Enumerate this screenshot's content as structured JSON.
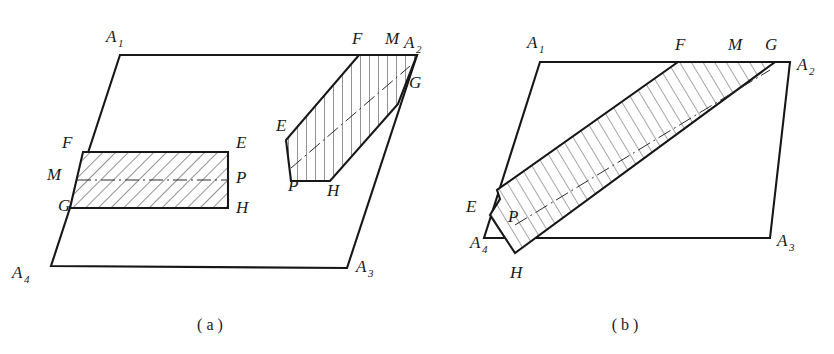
{
  "figure": {
    "background_color": "#ffffff",
    "line_color": "#171717"
  },
  "panel_a": {
    "caption": "( a )",
    "caption_x": 210,
    "caption_y": 330,
    "parallelogram": {
      "name": "outer-parallelogram-a",
      "points": "120,55 417,55 347,268 51,266",
      "vertex_labels": [
        {
          "id": "A",
          "sub": "1",
          "x": 106,
          "y": 42
        },
        {
          "id": "A",
          "sub": "2",
          "x": 404,
          "y": 48
        },
        {
          "id": "A",
          "sub": "3",
          "x": 356,
          "y": 272
        },
        {
          "id": "A",
          "sub": "4",
          "x": 12,
          "y": 278
        }
      ]
    },
    "rect_band": {
      "name": "hatched-rectangle-band-a",
      "points": "83,152 228,152 228,208 70,208",
      "center_divider": "77,180 228,180",
      "labels": [
        {
          "id": "F",
          "x": 62,
          "y": 148
        },
        {
          "id": "M",
          "x": 47,
          "y": 180
        },
        {
          "id": "G",
          "x": 58,
          "y": 211
        },
        {
          "id": "E",
          "x": 236,
          "y": 148
        },
        {
          "id": "P",
          "x": 236,
          "y": 183
        },
        {
          "id": "H",
          "x": 236,
          "y": 213
        }
      ]
    },
    "tilted_band": {
      "name": "hatched-tilted-band-a",
      "points": "359,55 417,55 398,104 330,181 291,181 286,140",
      "centerline": "291,168 410,66",
      "labels": [
        {
          "id": "F",
          "x": 352,
          "y": 44
        },
        {
          "id": "M",
          "x": 385,
          "y": 44
        },
        {
          "id": "G",
          "x": 409,
          "y": 88
        },
        {
          "id": "E",
          "x": 276,
          "y": 131
        },
        {
          "id": "P",
          "x": 288,
          "y": 191
        },
        {
          "id": "H",
          "x": 327,
          "y": 196
        }
      ]
    }
  },
  "panel_b": {
    "caption": "( b )",
    "caption_x": 625,
    "caption_y": 330,
    "parallelogram": {
      "name": "outer-parallelogram-b",
      "points": "540,62 790,62 770,238 484,238",
      "vertex_labels": [
        {
          "id": "A",
          "sub": "1",
          "x": 527,
          "y": 48
        },
        {
          "id": "A",
          "sub": "2",
          "x": 797,
          "y": 70
        },
        {
          "id": "A",
          "sub": "3",
          "x": 777,
          "y": 246
        },
        {
          "id": "A",
          "sub": "4",
          "x": 470,
          "y": 248
        }
      ]
    },
    "band": {
      "name": "hatched-band-b",
      "points": "678,62 775,62 515,253 490,215 500,199 497,190",
      "centerline": "515,225 770,70",
      "labels": [
        {
          "id": "F",
          "x": 675,
          "y": 50
        },
        {
          "id": "M",
          "x": 728,
          "y": 50
        },
        {
          "id": "G",
          "x": 765,
          "y": 50
        },
        {
          "id": "E",
          "x": 466,
          "y": 212
        },
        {
          "id": "P",
          "x": 508,
          "y": 222
        },
        {
          "id": "H",
          "x": 510,
          "y": 278
        }
      ]
    }
  }
}
